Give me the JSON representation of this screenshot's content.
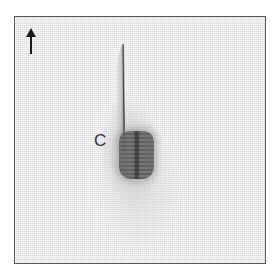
{
  "figure": {
    "panel_label": "C",
    "orientation_indicator": "up-arrow-icon",
    "colors": {
      "background": "#ededed",
      "border": "#555555",
      "specimen_dark": "#5a5a5a",
      "label": "#333333"
    }
  }
}
